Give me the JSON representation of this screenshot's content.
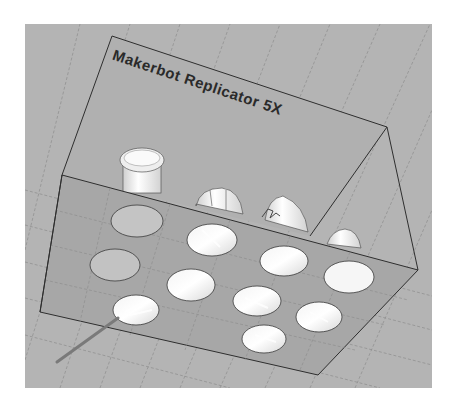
{
  "viewport": {
    "background": "#b4b4b4",
    "plate_color": "#a9a9a9",
    "grid_color": "#8a8a8a",
    "edge_color": "#2e2e2e"
  },
  "build_volume": {
    "label": "Makerbot Replicator 5X",
    "label_orientation": "mirrored-upside-down"
  },
  "objects": [
    {
      "name": "cylinder-knob",
      "kind": "printed-part"
    },
    {
      "name": "slotted-cap",
      "kind": "printed-part"
    },
    {
      "name": "dome-with-clip",
      "kind": "printed-part"
    },
    {
      "name": "small-dome",
      "kind": "printed-part"
    }
  ],
  "plate_holes": {
    "rows": 3,
    "count": 11
  }
}
